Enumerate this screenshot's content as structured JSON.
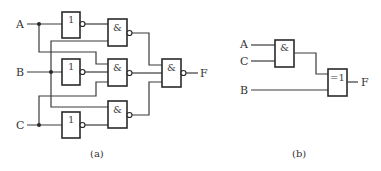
{
  "diagram_a": {
    "caption": "(a)",
    "inputs": {
      "a": "A",
      "b": "B",
      "c": "C"
    },
    "output": "F",
    "not_gates": [
      {
        "symbol": "1",
        "input": "A"
      },
      {
        "symbol": "1",
        "input": "B"
      },
      {
        "symbol": "1",
        "input": "C"
      }
    ],
    "nand_gates": [
      {
        "symbol": "&",
        "inputs": [
          "A'",
          "B"
        ]
      },
      {
        "symbol": "&",
        "inputs": [
          "A",
          "B'",
          "C"
        ]
      },
      {
        "symbol": "&",
        "inputs": [
          "B",
          "C'"
        ]
      }
    ],
    "final_gate": {
      "symbol": "&",
      "type": "NAND"
    }
  },
  "diagram_b": {
    "caption": "(b)",
    "inputs": {
      "a": "A",
      "c": "C",
      "b": "B"
    },
    "output": "F",
    "and_gate": {
      "symbol": "&"
    },
    "xor_gate": {
      "symbol": "=1"
    }
  }
}
